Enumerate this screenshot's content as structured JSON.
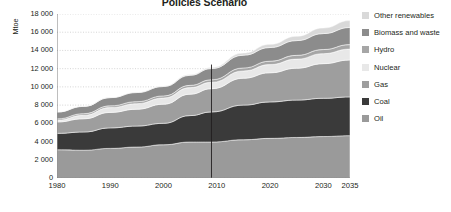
{
  "chart": {
    "title": "Policies Scenario",
    "ylabel": "Mtoe"
  },
  "axis": {
    "yticks": [
      "18 000",
      "16 000",
      "14 000",
      "12 000",
      "10 000",
      "8 000",
      "6 000",
      "4 000",
      "2 000",
      "0"
    ],
    "xticks": [
      "1980",
      "1990",
      "2000",
      "2010",
      "2020",
      "2030",
      "2035"
    ]
  },
  "legend": {
    "items": [
      {
        "label": "Other renewables",
        "color": "#d9d9d9"
      },
      {
        "label": "Biomass and waste",
        "color": "#8c8c8c"
      },
      {
        "label": "Hydro",
        "color": "#a6a6a6"
      },
      {
        "label": "Nuclear",
        "color": "#e8e8e8"
      },
      {
        "label": "Gas",
        "color": "#9e9e9e"
      },
      {
        "label": "Coal",
        "color": "#3a3a3a"
      },
      {
        "label": "Oil",
        "color": "#9a9a9a"
      }
    ]
  },
  "chart_data": {
    "type": "area",
    "title": "Policies Scenario",
    "xlabel": "",
    "ylabel": "Mtoe",
    "xlim": [
      1980,
      2035
    ],
    "ylim": [
      0,
      18000
    ],
    "ytick_step": 2000,
    "grid": "horizontal-dotted",
    "legend_position": "right",
    "stacked": true,
    "divider_year": 2009,
    "divider_note": "vertical line separating history from projections",
    "x": [
      1980,
      1985,
      1990,
      1995,
      2000,
      2005,
      2009,
      2015,
      2020,
      2025,
      2030,
      2035
    ],
    "series": [
      {
        "name": "Oil",
        "color": "#9a9a9a",
        "values": [
          3100,
          3050,
          3250,
          3400,
          3650,
          3950,
          3950,
          4200,
          4350,
          4450,
          4550,
          4650
        ]
      },
      {
        "name": "Coal",
        "color": "#3a3a3a",
        "values": [
          1800,
          2000,
          2250,
          2300,
          2350,
          2900,
          3300,
          3800,
          4000,
          4100,
          4200,
          4250
        ]
      },
      {
        "name": "Gas",
        "color": "#9e9e9e",
        "values": [
          1250,
          1450,
          1700,
          1850,
          2100,
          2350,
          2550,
          2950,
          3200,
          3500,
          3800,
          4050
        ]
      },
      {
        "name": "Nuclear",
        "color": "#e8e8e8",
        "values": [
          190,
          380,
          530,
          610,
          680,
          720,
          700,
          800,
          900,
          1000,
          1100,
          1200
        ]
      },
      {
        "name": "Hydro",
        "color": "#a6a6a6",
        "values": [
          150,
          180,
          190,
          220,
          230,
          250,
          280,
          330,
          370,
          410,
          450,
          490
        ]
      },
      {
        "name": "Biomass and waste",
        "color": "#8c8c8c",
        "values": [
          750,
          800,
          900,
          1000,
          1030,
          1100,
          1230,
          1400,
          1500,
          1620,
          1750,
          1880
        ]
      },
      {
        "name": "Other renewables",
        "color": "#d9d9d9",
        "values": [
          12,
          18,
          30,
          45,
          60,
          85,
          110,
          230,
          350,
          480,
          620,
          760
        ]
      }
    ],
    "totals": [
      7252,
      7878,
      8850,
      9425,
      10100,
      11355,
      12120,
      13710,
      14670,
      15560,
      16470,
      17280
    ]
  }
}
